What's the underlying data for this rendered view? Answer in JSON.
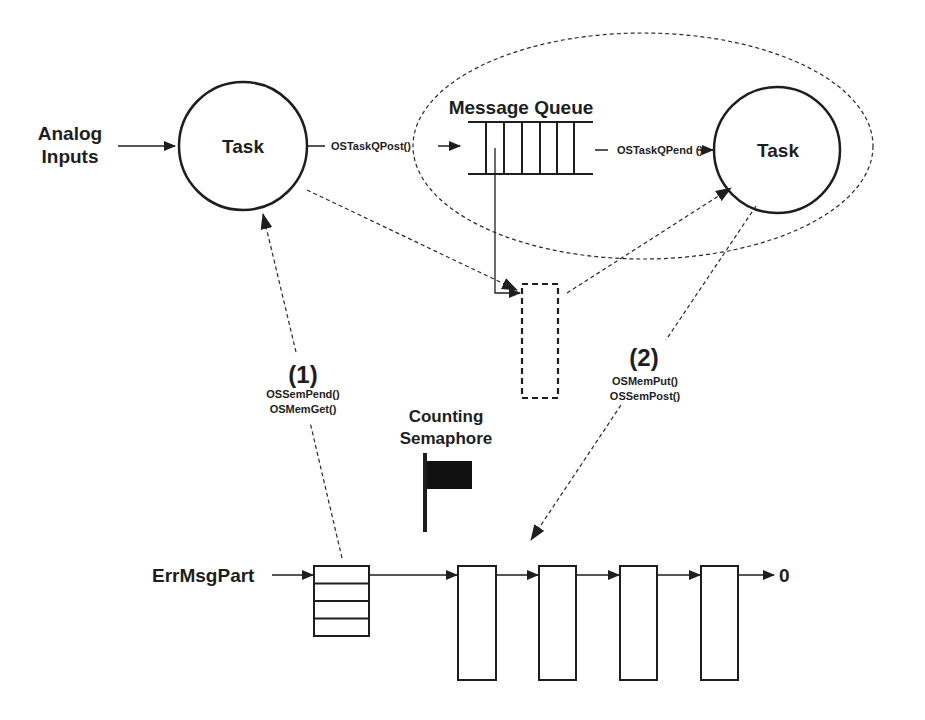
{
  "diagram": {
    "inputs": {
      "analog_line1": "Analog",
      "analog_line2": "Inputs"
    },
    "tasks": {
      "producer": "Task",
      "consumer": "Task"
    },
    "queue": {
      "title": "Message Queue",
      "slots": 6
    },
    "calls": {
      "post": "OSTaskQPost()",
      "pend": "OSTaskQPend ()"
    },
    "step1": {
      "number": "(1)",
      "call1": "OSSemPend()",
      "call2": "OSMemGet()"
    },
    "step2": {
      "number": "(2)",
      "call1": "OSMemPut()",
      "call2": "OSSemPost()"
    },
    "semaphore": {
      "line1": "Counting",
      "line2": "Semaphore"
    },
    "partition": {
      "label": "ErrMsgPart",
      "stack_rows": 4,
      "free_blocks": 4,
      "terminator": "0"
    },
    "colors": {
      "stroke": "#1e1e1e",
      "background": "#ffffff"
    }
  }
}
